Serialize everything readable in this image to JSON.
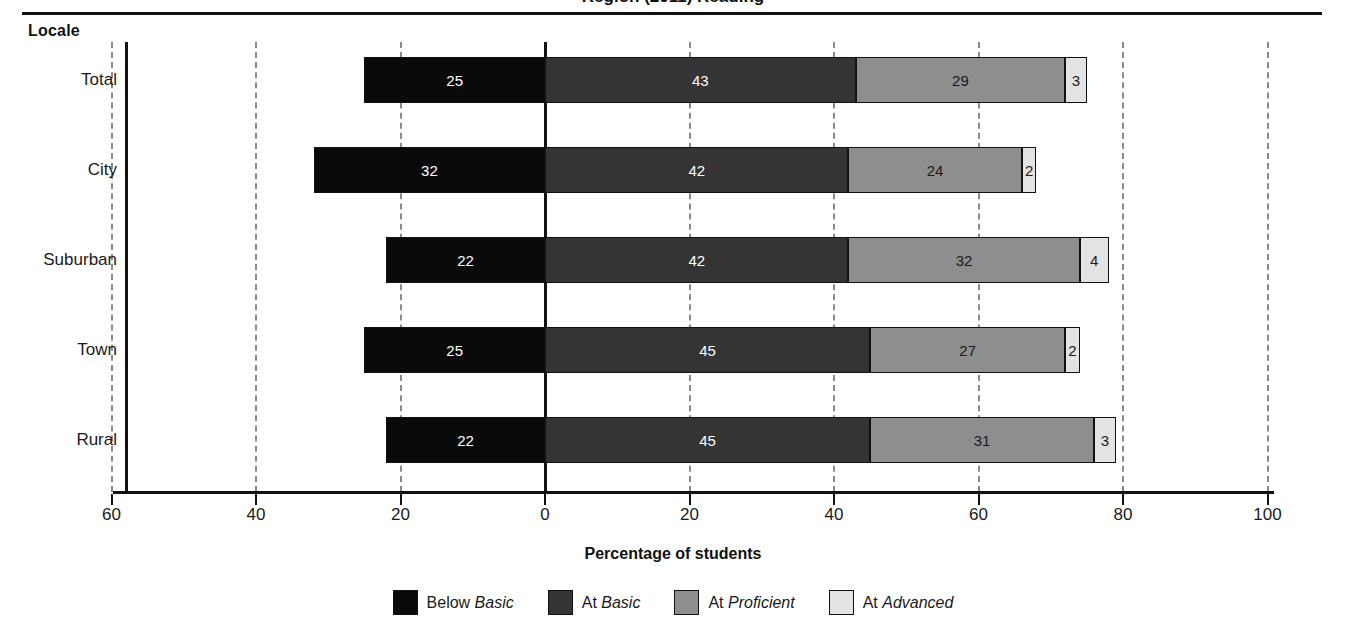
{
  "title": "Region (2011) Reading",
  "category_axis_header": "Locale",
  "x_axis_title": "Percentage of students",
  "colors": {
    "below_basic": "#0a0a0a",
    "at_basic": "#343434",
    "at_proficient": "#8e8e8e",
    "at_advanced": "#e3e3e3",
    "axis": "#111111",
    "gridline": "#8a8a8a",
    "background": "#ffffff"
  },
  "legend": [
    {
      "name": "below-basic-swatch",
      "prefix": "Below ",
      "level": "Basic"
    },
    {
      "name": "at-basic-swatch",
      "prefix": "At ",
      "level": "Basic"
    },
    {
      "name": "at-proficient-swatch",
      "prefix": "At ",
      "level": "Proficient"
    },
    {
      "name": "at-advanced-swatch",
      "prefix": "At ",
      "level": "Advanced"
    }
  ],
  "x_ticks": [
    "60",
    "40",
    "20",
    "0",
    "20",
    "40",
    "60",
    "80",
    "100"
  ],
  "chart_data": {
    "type": "bar",
    "orientation": "horizontal",
    "stacked": true,
    "diverging_at": 0,
    "title": "Region (2011) Reading",
    "xlabel": "Percentage of students",
    "ylabel": "Locale",
    "xlim": [
      -60,
      100
    ],
    "xticks": [
      -60,
      -40,
      -20,
      0,
      20,
      40,
      60,
      80,
      100
    ],
    "xtick_labels": [
      "60",
      "40",
      "20",
      "0",
      "20",
      "40",
      "60",
      "80",
      "100"
    ],
    "grid": true,
    "grid_style": "dashed-vertical",
    "legend_position": "bottom",
    "categories": [
      "Total",
      "City",
      "Suburban",
      "Town",
      "Rural"
    ],
    "series": [
      {
        "name": "Below Basic",
        "side": "left",
        "values": [
          25,
          32,
          22,
          25,
          22
        ]
      },
      {
        "name": "At Basic",
        "side": "right",
        "values": [
          43,
          42,
          42,
          45,
          45
        ]
      },
      {
        "name": "At Proficient",
        "side": "right",
        "values": [
          29,
          24,
          32,
          27,
          31
        ]
      },
      {
        "name": "At Advanced",
        "side": "right",
        "values": [
          3,
          2,
          4,
          2,
          3
        ]
      }
    ]
  }
}
